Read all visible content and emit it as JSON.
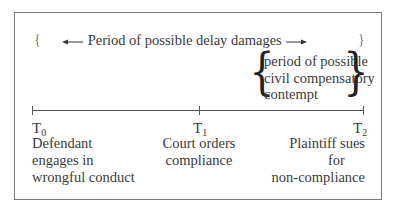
{
  "diagram": {
    "type": "timeline",
    "top_span": {
      "label": "Period of possible delay damages",
      "left_arrow": "←",
      "right_arrow": "→",
      "left_brace": "{",
      "right_brace": "}"
    },
    "sub_span": {
      "lines": [
        "period of possible",
        "civil compensatory",
        "contempt"
      ],
      "left_brace": "{",
      "right_brace": "}"
    },
    "points": [
      {
        "symbol": "T",
        "subscript": "0",
        "description": [
          "Defendant",
          "engages in",
          "wrongful conduct"
        ]
      },
      {
        "symbol": "T",
        "subscript": "1",
        "description": [
          "Court orders",
          "compliance"
        ]
      },
      {
        "symbol": "T",
        "subscript": "2",
        "description": [
          "Plaintiff sues",
          "for",
          "non-compliance"
        ]
      }
    ]
  }
}
